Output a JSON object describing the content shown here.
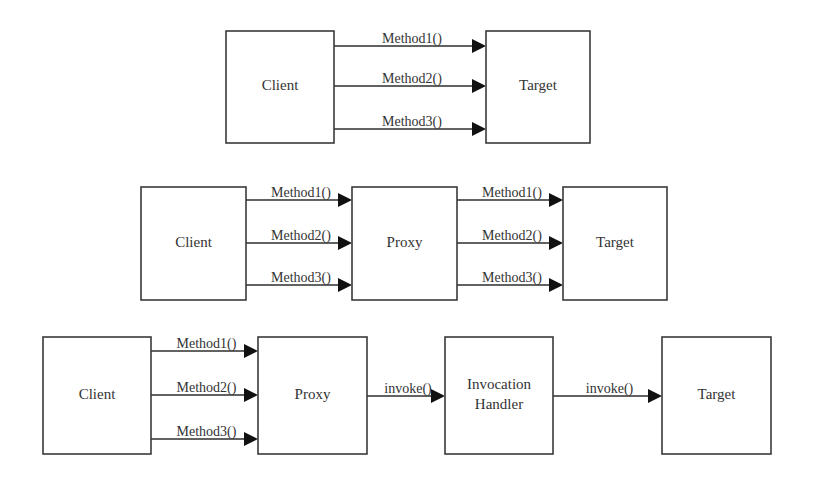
{
  "colors": {
    "background": "#ffffff",
    "box_stroke": "#3a3a3a",
    "line": "#2e2e2e",
    "arrowhead": "#111111",
    "text": "#333333"
  },
  "diagrams": [
    {
      "name": "direct-call",
      "boxes": [
        {
          "id": "client",
          "label_lines": [
            "Client"
          ],
          "x": 226,
          "y": 31,
          "w": 108,
          "h": 112
        },
        {
          "id": "target",
          "label_lines": [
            "Target"
          ],
          "x": 486,
          "y": 31,
          "w": 104,
          "h": 112
        }
      ],
      "edges": [
        {
          "label": "Method1()",
          "x1": 334,
          "x2": 486,
          "y": 46
        },
        {
          "label": "Method2()",
          "x1": 334,
          "x2": 486,
          "y": 86
        },
        {
          "label": "Method3()",
          "x1": 334,
          "x2": 486,
          "y": 129
        }
      ]
    },
    {
      "name": "static-proxy",
      "boxes": [
        {
          "id": "client",
          "label_lines": [
            "Client"
          ],
          "x": 141,
          "y": 187,
          "w": 105,
          "h": 113
        },
        {
          "id": "proxy",
          "label_lines": [
            "Proxy"
          ],
          "x": 352,
          "y": 187,
          "w": 105,
          "h": 113
        },
        {
          "id": "target",
          "label_lines": [
            "Target"
          ],
          "x": 563,
          "y": 187,
          "w": 104,
          "h": 113
        }
      ],
      "edges": [
        {
          "label": "Method1()",
          "x1": 246,
          "x2": 352,
          "y": 200
        },
        {
          "label": "Method2()",
          "x1": 246,
          "x2": 352,
          "y": 243
        },
        {
          "label": "Method3()",
          "x1": 246,
          "x2": 352,
          "y": 285
        },
        {
          "label": "Method1()",
          "x1": 457,
          "x2": 563,
          "y": 200
        },
        {
          "label": "Method2()",
          "x1": 457,
          "x2": 563,
          "y": 243
        },
        {
          "label": "Method3()",
          "x1": 457,
          "x2": 563,
          "y": 285
        }
      ]
    },
    {
      "name": "dynamic-proxy",
      "boxes": [
        {
          "id": "client",
          "label_lines": [
            "Client"
          ],
          "x": 43,
          "y": 337,
          "w": 108,
          "h": 117
        },
        {
          "id": "proxy",
          "label_lines": [
            "Proxy"
          ],
          "x": 258,
          "y": 337,
          "w": 109,
          "h": 117
        },
        {
          "id": "invocation-handler",
          "label_lines": [
            "Invocation",
            "Handler"
          ],
          "x": 445,
          "y": 337,
          "w": 108,
          "h": 117
        },
        {
          "id": "target",
          "label_lines": [
            "Target"
          ],
          "x": 662,
          "y": 337,
          "w": 109,
          "h": 117
        }
      ],
      "edges": [
        {
          "label": "Method1()",
          "x1": 151,
          "x2": 258,
          "y": 351
        },
        {
          "label": "Method2()",
          "x1": 151,
          "x2": 258,
          "y": 395
        },
        {
          "label": "Method3()",
          "x1": 151,
          "x2": 258,
          "y": 439
        },
        {
          "label": "invoke()",
          "x1": 367,
          "x2": 445,
          "y": 396
        },
        {
          "label": "invoke()",
          "x1": 553,
          "x2": 662,
          "y": 396
        }
      ]
    }
  ]
}
